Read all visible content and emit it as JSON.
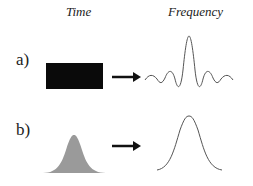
{
  "headers": {
    "time": "Time",
    "frequency": "Frequency"
  },
  "rows": [
    {
      "label": "a)",
      "time_shape": "rectangle",
      "frequency_shape": "sinc"
    },
    {
      "label": "b)",
      "time_shape": "gaussian",
      "frequency_shape": "gaussian"
    }
  ],
  "colors": {
    "rect_fill": "#0a0a0a",
    "gaussian_fill": "#9a9a9a",
    "curve_stroke": "#555555",
    "arrow": "#111111"
  }
}
